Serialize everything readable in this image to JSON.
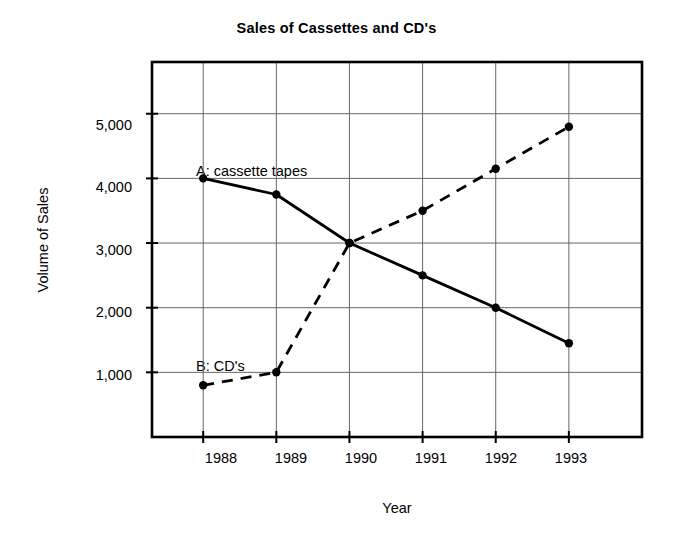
{
  "chart_data": {
    "type": "line",
    "title": "Sales of Cassettes and CD's",
    "xlabel": "Year",
    "ylabel": "Volume of Sales",
    "x": [
      1988,
      1989,
      1990,
      1991,
      1992,
      1993
    ],
    "categories": [
      "1988",
      "1989",
      "1990",
      "1991",
      "1992",
      "1993"
    ],
    "xtick_labels": [
      "1988",
      "1989",
      "1990",
      "1991",
      "1992",
      "1993"
    ],
    "ytick_labels": [
      "1,000",
      "2,000",
      "3,000",
      "4,000",
      "5,000"
    ],
    "yticks": [
      1000,
      2000,
      3000,
      4000,
      5000
    ],
    "ylim": [
      0,
      5800
    ],
    "xlim": [
      1987.3,
      1994.0
    ],
    "grid": true,
    "legend_position": "inline-annotation",
    "series": [
      {
        "name": "A: cassette tapes",
        "key": "cassette-tapes",
        "linestyle": "solid",
        "color": "#000000",
        "marker": "circle",
        "values": [
          4000,
          3750,
          3000,
          2500,
          2000,
          1450
        ]
      },
      {
        "name": "B: CD's",
        "key": "cds",
        "linestyle": "dashed",
        "color": "#000000",
        "marker": "circle",
        "values": [
          800,
          1000,
          3000,
          3500,
          4150,
          4800
        ]
      }
    ],
    "annotations": [
      {
        "text": "A: cassette tapes",
        "x": 1988.05,
        "y": 4330
      },
      {
        "text": "B: CD's",
        "x": 1988.05,
        "y": 1230
      }
    ]
  },
  "axis": {
    "y_labels": [
      "5,000",
      "4,000",
      "3,000",
      "2,000",
      "1,000"
    ],
    "x_labels": [
      "1988",
      "1989",
      "1990",
      "1991",
      "1992",
      "1993"
    ],
    "y_title": "Volume of Sales",
    "x_title": "Year"
  },
  "colors": {
    "ink": "#000000",
    "grid": "#666666",
    "background": "#ffffff"
  }
}
